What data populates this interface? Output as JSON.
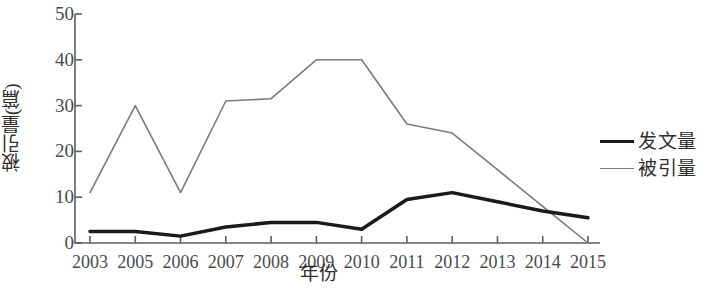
{
  "chart_data": {
    "type": "line",
    "title": "",
    "xlabel": "年份",
    "ylabel": "被引量(篇)",
    "categories": [
      "2003",
      "2005",
      "2006",
      "2007",
      "2008",
      "2009",
      "2010",
      "2011",
      "2012",
      "2013",
      "2014",
      "2015"
    ],
    "series": [
      {
        "name": "发文量",
        "color": "#1a1a1a",
        "width": 3.5,
        "values": [
          2.5,
          2.5,
          1.5,
          3.5,
          4.5,
          4.5,
          3,
          9.5,
          11,
          9,
          7,
          5.5
        ]
      },
      {
        "name": "被引量",
        "color": "#7b7b7b",
        "width": 1.6,
        "values": [
          11,
          30,
          11,
          31,
          31.5,
          40,
          40,
          26,
          24,
          16,
          8,
          0
        ]
      }
    ],
    "ylim": [
      0,
      50
    ],
    "yticks": [
      0,
      10,
      20,
      30,
      40,
      50
    ],
    "ytick_labels": [
      "0",
      "10",
      "20",
      "30",
      "40",
      "50"
    ],
    "grid": false,
    "legend_position": "right"
  },
  "legend": {
    "items": [
      {
        "label": "发文量",
        "style": "thick"
      },
      {
        "label": "被引量",
        "style": "thin"
      }
    ]
  },
  "axes": {
    "y_title": "被引量(篇)",
    "x_title": "年份"
  }
}
